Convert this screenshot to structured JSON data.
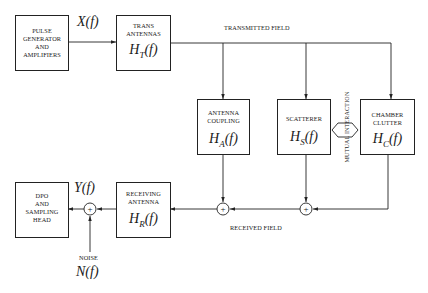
{
  "diagram": {
    "type": "signal-flow block diagram",
    "blocks": {
      "pulse_generator": {
        "lines": [
          "PULSE",
          "GENERATOR",
          "AND",
          "AMPLIFIERS"
        ]
      },
      "trans_antennas": {
        "lines": [
          "TRANS",
          "ANTENNAS"
        ],
        "fn_symbol": "H",
        "fn_sub": "T",
        "fn_arg": "(f)"
      },
      "antenna_coupling": {
        "lines": [
          "ANTENNA",
          "COUPLING"
        ],
        "fn_symbol": "H",
        "fn_sub": "A",
        "fn_arg": "(f)"
      },
      "scatterer": {
        "lines": [
          "SCATTERER"
        ],
        "fn_symbol": "H",
        "fn_sub": "S",
        "fn_arg": "(f)"
      },
      "chamber_clutter": {
        "lines": [
          "CHAMBER",
          "CLUTTER"
        ],
        "fn_symbol": "H",
        "fn_sub": "C",
        "fn_arg": "(f)"
      },
      "receiving_antenna": {
        "lines": [
          "RECEIVING",
          "ANTENNA"
        ],
        "fn_symbol": "H",
        "fn_sub": "R",
        "fn_arg": "(f)"
      },
      "dpo": {
        "lines": [
          "DPO",
          "AND",
          "SAMPLING",
          "HEAD"
        ]
      }
    },
    "signals": {
      "input": "X(f)",
      "output": "Y(f)",
      "noise": "N(f)"
    },
    "labels": {
      "transmitted_field": "TRANSMITTED FIELD",
      "received_field": "RECEIVED FIELD",
      "mutual_interaction": "MUTUAL INTERACTION",
      "noise": "NOISE"
    },
    "summing_junction_symbol": "+",
    "colors": {
      "line": "#222222",
      "background": "#ffffff"
    }
  }
}
